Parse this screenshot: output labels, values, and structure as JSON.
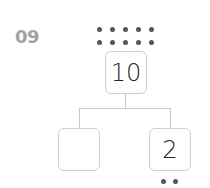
{
  "problem": {
    "number_label": "09",
    "top_dots_count": 10,
    "whole_value": "10",
    "left_part_value": "",
    "right_part_value": "2",
    "bottom_dots_count": 2
  },
  "colors": {
    "label": "#a3a3a3",
    "dots": "#555555",
    "box_border": "#cfcfcf",
    "lines": "#c8c8c8"
  }
}
